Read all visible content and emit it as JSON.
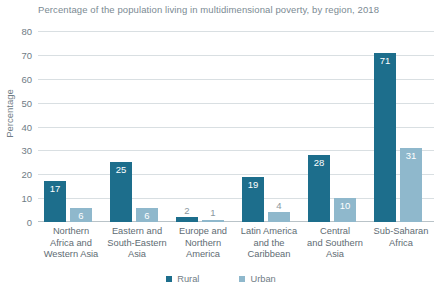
{
  "chart_data": {
    "type": "bar",
    "title": "Percentage of the population living in multidimensional poverty, by region, 2018",
    "xlabel": "",
    "ylabel": "Percentage",
    "ylim": [
      0,
      80
    ],
    "yticks": [
      80,
      70,
      60,
      50,
      40,
      30,
      20,
      10,
      0
    ],
    "grid": true,
    "legend_position": "bottom-center",
    "categories": [
      "Northern Africa and Western Asia",
      "Eastern and South-Eastern Asia",
      "Europe and Northern America",
      "Latin America and the Caribbean",
      "Central and Southern Asia",
      "Sub-Saharan Africa"
    ],
    "category_lines": [
      [
        "Northern",
        "Africa and",
        "Western Asia"
      ],
      [
        "Eastern and",
        "South-Eastern",
        "Asia"
      ],
      [
        "Europe and",
        "Northern",
        "America"
      ],
      [
        "Latin America",
        "and the",
        "Caribbean"
      ],
      [
        "Central",
        "and Southern",
        "Asia"
      ],
      [
        "Sub-Saharan",
        "Africa"
      ]
    ],
    "series": [
      {
        "name": "Rural",
        "color": "#1d6e8c",
        "values": [
          17,
          25,
          2,
          19,
          28,
          71
        ]
      },
      {
        "name": "Urban",
        "color": "#8fb8cc",
        "values": [
          6,
          6,
          1,
          4,
          10,
          31
        ]
      }
    ]
  },
  "legend": {
    "items": [
      {
        "label": "Rural",
        "color": "#1d6e8c"
      },
      {
        "label": "Urban",
        "color": "#8fb8cc"
      }
    ]
  }
}
